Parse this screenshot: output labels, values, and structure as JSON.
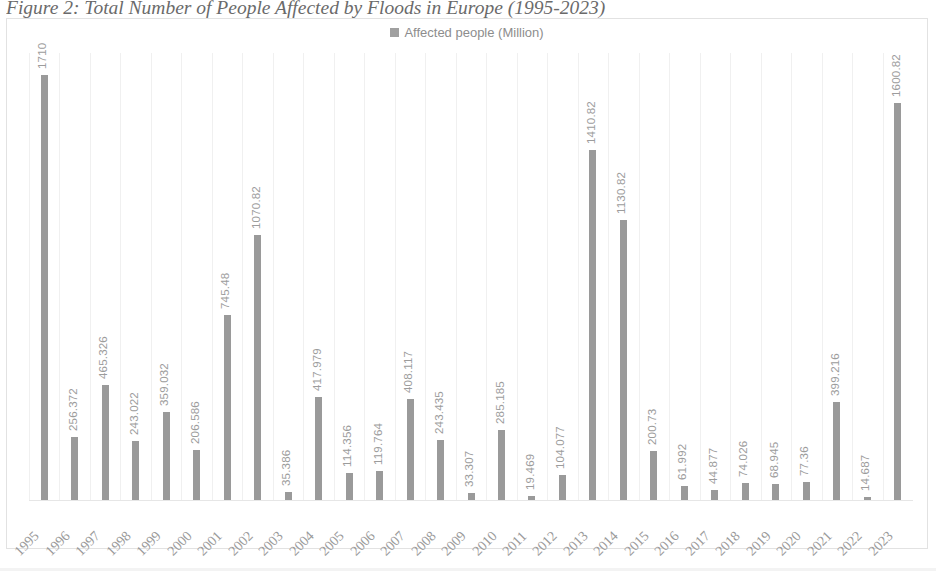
{
  "caption": "Figure 2: Total Number of People Affected by Floods in Europe (1995-2023)",
  "legend": {
    "label": "Affected people (Million)",
    "swatch_color": "#a0a0a0"
  },
  "colors": {
    "bar": "#9a9a9a",
    "data_label": "#9c9c9c",
    "axis_label": "#9a9a9a",
    "gridline": "#f0f0f0",
    "frame_border": "#e2e2e2",
    "caption_text": "#4a4a4a"
  },
  "chart_data": {
    "type": "bar",
    "title": "Figure 2: Total Number of People Affected by Floods in Europe (1995-2023)",
    "xlabel": "",
    "ylabel": "",
    "ylim": [
      0,
      1800
    ],
    "grid": true,
    "legend_position": "top-center",
    "series_name": "Affected people (Million)",
    "categories": [
      "1995",
      "1996",
      "1997",
      "1998",
      "1999",
      "2000",
      "2001",
      "2002",
      "2003",
      "2004",
      "2005",
      "2006",
      "2007",
      "2008",
      "2009",
      "2010",
      "2011",
      "2012",
      "2013",
      "2014",
      "2015",
      "2016",
      "2017",
      "2018",
      "2019",
      "2020",
      "2021",
      "2022",
      "2023"
    ],
    "values": [
      1710,
      256.372,
      465.326,
      243.022,
      359.032,
      206.586,
      745.48,
      1070.82,
      35.386,
      417.979,
      114.356,
      119.764,
      408.117,
      243.435,
      33.307,
      285.185,
      19.469,
      104.077,
      1410.82,
      1130.82,
      200.73,
      61.992,
      44.877,
      74.026,
      68.945,
      77.36,
      399.216,
      14.687,
      1600.82
    ],
    "value_labels": [
      "1710",
      "256.372",
      "465.326",
      "243.022",
      "359.032",
      "206.586",
      "745.48",
      "1070.82",
      "35.386",
      "417.979",
      "114.356",
      "119.764",
      "408.117",
      "243.435",
      "33.307",
      "285.185",
      "19.469",
      "104.077",
      "1410.82",
      "1130.82",
      "200.73",
      "61.992",
      "44.877",
      "74.026",
      "68.945",
      "77.36",
      "399.216",
      "14.687",
      "1600.82"
    ]
  }
}
